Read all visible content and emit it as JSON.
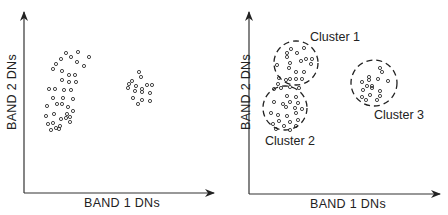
{
  "colors": {
    "ink": "#222222",
    "background": "#ffffff"
  },
  "panels": [
    {
      "id": "unclustered",
      "xlabel": "BAND 1 DNs",
      "ylabel": "BAND 2 DNs",
      "clusters": []
    },
    {
      "id": "clustered",
      "xlabel": "BAND 1 DNs",
      "ylabel": "BAND 2 DNs",
      "clusters": [
        {
          "label": "Cluster 1"
        },
        {
          "label": "Cluster 2"
        },
        {
          "label": "Cluster 3"
        }
      ]
    }
  ],
  "chart_data": [
    {
      "type": "scatter",
      "title": "",
      "xlabel": "BAND 1 DNs",
      "ylabel": "BAND 2 DNs",
      "grid": false,
      "ticks": "none",
      "series": [
        {
          "name": "points",
          "points": [
            [
              66,
              53
            ],
            [
              78,
              52
            ],
            [
              61,
              59
            ],
            [
              71,
              57
            ],
            [
              89,
              57
            ],
            [
              56,
              64
            ],
            [
              77,
              62
            ],
            [
              84,
              66
            ],
            [
              53,
              69
            ],
            [
              62,
              71
            ],
            [
              69,
              75
            ],
            [
              75,
              75
            ],
            [
              62,
              80
            ],
            [
              69,
              82
            ],
            [
              76,
              82
            ],
            [
              49,
              89
            ],
            [
              55,
              89
            ],
            [
              64,
              90
            ],
            [
              71,
              90
            ],
            [
              53,
              98
            ],
            [
              63,
              98
            ],
            [
              73,
              99
            ],
            [
              47,
              106
            ],
            [
              57,
              104
            ],
            [
              62,
              104
            ],
            [
              68,
              107
            ],
            [
              73,
              111
            ],
            [
              46,
              116
            ],
            [
              54,
              114
            ],
            [
              66,
              118
            ],
            [
              53,
              123
            ],
            [
              61,
              119
            ],
            [
              67,
              114
            ],
            [
              70,
              117
            ],
            [
              60,
              126
            ],
            [
              70,
              122
            ],
            [
              48,
              124
            ],
            [
              56,
              128
            ],
            [
              51,
              130
            ],
            [
              59,
              129
            ],
            [
              139,
              72
            ],
            [
              141,
              77
            ],
            [
              132,
              81
            ],
            [
              147,
              85
            ],
            [
              129,
              84
            ],
            [
              136,
              86
            ],
            [
              142,
              89
            ],
            [
              152,
              85
            ],
            [
              128,
              88
            ],
            [
              135,
              91
            ],
            [
              142,
              92
            ],
            [
              150,
              93
            ],
            [
              133,
              98
            ],
            [
              142,
              100
            ],
            [
              150,
              101
            ],
            [
              138,
              104
            ]
          ]
        }
      ]
    },
    {
      "type": "scatter",
      "title": "",
      "xlabel": "BAND 1 DNs",
      "ylabel": "BAND 2 DNs",
      "grid": false,
      "ticks": "none",
      "series": [
        {
          "name": "Cluster 1",
          "center": [
            296,
            63
          ],
          "radius": 22,
          "points": [
            [
              291,
              49
            ],
            [
              304,
              48
            ],
            [
              287,
              53
            ],
            [
              297,
              53
            ],
            [
              287,
              57
            ],
            [
              306,
              59
            ],
            [
              301,
              61
            ],
            [
              290,
              63
            ],
            [
              312,
              59
            ],
            [
              277,
              65
            ],
            [
              311,
              64
            ],
            [
              289,
              68
            ],
            [
              296,
              72
            ],
            [
              304,
              72
            ],
            [
              279,
              78
            ],
            [
              290,
              79
            ],
            [
              296,
              79
            ],
            [
              302,
              79
            ],
            [
              278,
              84
            ],
            [
              286,
              80
            ]
          ]
        },
        {
          "name": "Cluster 2",
          "center": [
            285,
            108
          ],
          "radius": 22,
          "points": [
            [
              274,
              89
            ],
            [
              281,
              88
            ],
            [
              290,
              87
            ],
            [
              299,
              88
            ],
            [
              287,
              96
            ],
            [
              296,
              97
            ],
            [
              274,
              102
            ],
            [
              283,
              104
            ],
            [
              290,
              102
            ],
            [
              298,
              103
            ],
            [
              286,
              107
            ],
            [
              295,
              108
            ],
            [
              302,
              109
            ],
            [
              271,
              113
            ],
            [
              278,
              115
            ],
            [
              287,
              116
            ],
            [
              296,
              113
            ],
            [
              279,
              121
            ],
            [
              290,
              122
            ],
            [
              298,
              120
            ],
            [
              273,
              124
            ],
            [
              284,
              126
            ],
            [
              296,
              126
            ],
            [
              276,
              129
            ],
            [
              290,
              130
            ]
          ]
        },
        {
          "name": "Cluster 3",
          "center": [
            374,
            83
          ],
          "radius": 23,
          "points": [
            [
              380,
              68
            ],
            [
              382,
              72
            ],
            [
              369,
              77
            ],
            [
              362,
              82
            ],
            [
              369,
              80
            ],
            [
              378,
              79
            ],
            [
              388,
              81
            ],
            [
              367,
              86
            ],
            [
              372,
              86
            ],
            [
              363,
              90
            ],
            [
              372,
              88
            ],
            [
              380,
              91
            ],
            [
              362,
              97
            ],
            [
              370,
              95
            ],
            [
              380,
              96
            ],
            [
              366,
              100
            ],
            [
              377,
              100
            ]
          ]
        }
      ]
    }
  ]
}
